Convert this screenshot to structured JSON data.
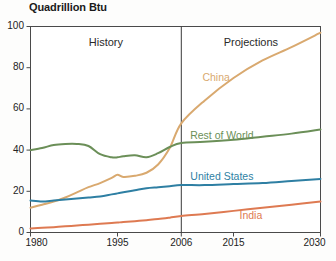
{
  "chart_data": {
    "type": "line",
    "title": "Quadrillion Btu",
    "xlabel": "",
    "ylabel": "Quadrillion Btu",
    "xlim": [
      1980,
      2030
    ],
    "ylim": [
      0,
      100
    ],
    "yticks": [
      0,
      20,
      40,
      60,
      80,
      100
    ],
    "xticks": [
      1980,
      1995,
      2006,
      2015,
      2030
    ],
    "grid": false,
    "legend_position": "inline-labels",
    "divider_year": 2006,
    "annotations": [
      {
        "text": "History",
        "x": 1993,
        "y": 92
      },
      {
        "text": "Projections",
        "x": 2018,
        "y": 92
      }
    ],
    "x": [
      1980,
      1982,
      1984,
      1986,
      1988,
      1990,
      1992,
      1994,
      1995,
      1996,
      1998,
      2000,
      2002,
      2004,
      2006,
      2010,
      2015,
      2020,
      2025,
      2030
    ],
    "series": [
      {
        "name": "China",
        "color": "#d9a96f",
        "label_x": 2012,
        "label_y": 75,
        "values": [
          12.0,
          13.5,
          15.0,
          17.0,
          19.5,
          22.0,
          24.0,
          26.5,
          28.0,
          27.0,
          27.5,
          29.0,
          33.0,
          41.0,
          53.0,
          64.0,
          75.0,
          83.5,
          90.0,
          97.0
        ]
      },
      {
        "name": "Rest of World",
        "color": "#6b8f58",
        "label_x": 2013,
        "label_y": 47,
        "values": [
          40.0,
          41.0,
          42.5,
          43.0,
          43.0,
          42.0,
          38.0,
          36.5,
          36.5,
          37.0,
          37.5,
          36.5,
          38.5,
          41.5,
          43.5,
          44.0,
          45.0,
          46.5,
          48.0,
          50.0
        ]
      },
      {
        "name": "United States",
        "color": "#2e7fa3",
        "label_x": 2013,
        "label_y": 27,
        "values": [
          15.5,
          15.0,
          15.5,
          16.0,
          16.5,
          17.0,
          17.5,
          18.5,
          19.0,
          19.5,
          20.5,
          21.5,
          22.0,
          22.5,
          23.0,
          23.0,
          23.5,
          24.0,
          25.0,
          26.0
        ]
      },
      {
        "name": "India",
        "color": "#de7a52",
        "label_x": 2018,
        "label_y": 8,
        "values": [
          2.0,
          2.3,
          2.6,
          3.0,
          3.4,
          3.8,
          4.2,
          4.6,
          4.8,
          5.1,
          5.5,
          6.0,
          6.5,
          7.2,
          8.0,
          9.0,
          10.5,
          12.0,
          13.5,
          15.0
        ]
      }
    ]
  },
  "panels": {
    "history_label": "History",
    "projections_label": "Projections"
  }
}
